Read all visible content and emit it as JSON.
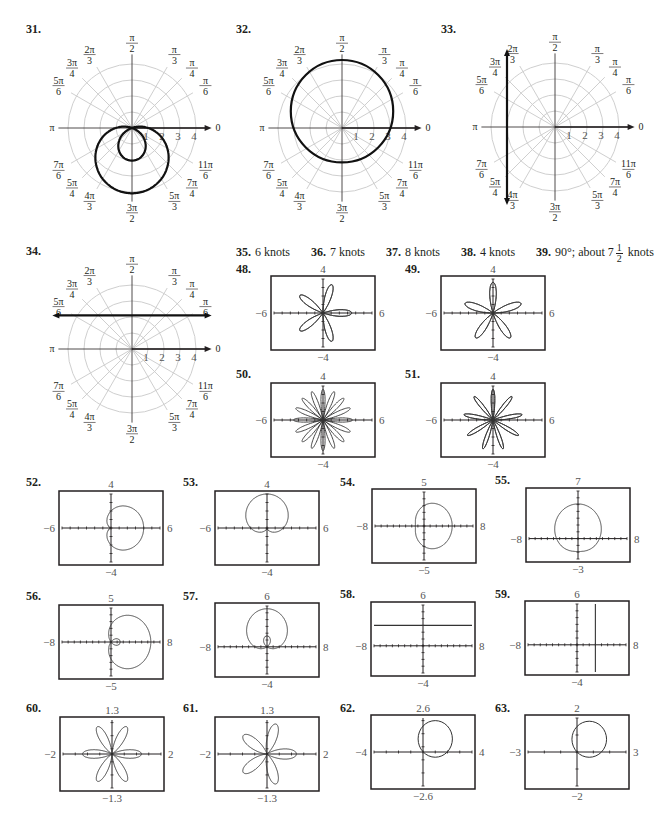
{
  "polar_graphs": [
    {
      "id": "31",
      "label": "31.",
      "label_pos": [
        26,
        22
      ],
      "center": [
        132,
        128
      ],
      "curve": {
        "type": "limacon_inner",
        "a": -1,
        "b": -3,
        "note": "r = -1 - 3 sin θ style limaçon with inner loop"
      }
    },
    {
      "id": "32",
      "label": "32.",
      "label_pos": [
        236,
        22
      ],
      "center": [
        342,
        128
      ],
      "curve": {
        "type": "circle",
        "desc": "circle through pole region, center (0,1), radius ~3.2"
      }
    },
    {
      "id": "33",
      "label": "33.",
      "label_pos": [
        441,
        22
      ],
      "center": [
        555,
        127
      ],
      "curve": {
        "type": "vertical_line",
        "x": -3
      }
    },
    {
      "id": "34",
      "label": "34.",
      "label_pos": [
        26,
        244
      ],
      "center": [
        132,
        349
      ],
      "curve": {
        "type": "horizontal_line",
        "y": 2
      }
    }
  ],
  "polar_axis": {
    "angle_labels": [
      "0",
      "π/6",
      "π/4",
      "π/3",
      "π/2",
      "2π/3",
      "3π/4",
      "5π/6",
      "π",
      "7π/6",
      "5π/4",
      "4π/3",
      "3π/2",
      "5π/3",
      "7π/4",
      "11π/6"
    ],
    "radial_ticks": [
      "1",
      "2",
      "3",
      "4"
    ]
  },
  "answers": [
    {
      "num": "35.",
      "text": "6 knots"
    },
    {
      "num": "36.",
      "text": "7 knots"
    },
    {
      "num": "37.",
      "text": "8 knots"
    },
    {
      "num": "38.",
      "text": "4 knots"
    },
    {
      "num": "39.",
      "text": "90°; about 7",
      "frac_num": "1",
      "frac_den": "2",
      "suffix": " knots"
    }
  ],
  "chart_data": [
    {
      "id": "48",
      "type": "line",
      "label": "48.",
      "xlim": [
        -6,
        6
      ],
      "ylim": [
        -4,
        4
      ],
      "curve": "rose 5 petals, one petal along +x",
      "box": [
        271,
        276,
        104,
        74
      ],
      "label_pos": [
        236,
        262
      ]
    },
    {
      "id": "49",
      "type": "line",
      "label": "49.",
      "xlim": [
        -6,
        6
      ],
      "ylim": [
        -4,
        4
      ],
      "curve": "rose 5 petals, one petal along +y",
      "box": [
        441,
        276,
        104,
        74
      ],
      "label_pos": [
        405,
        262
      ]
    },
    {
      "id": "50",
      "type": "line",
      "label": "50.",
      "xlim": [
        -6,
        6
      ],
      "ylim": [
        -4,
        4
      ],
      "curve": "rose 16 petals",
      "box": [
        271,
        383,
        104,
        74
      ],
      "label_pos": [
        236,
        367
      ]
    },
    {
      "id": "51",
      "type": "line",
      "label": "51.",
      "xlim": [
        -6,
        6
      ],
      "ylim": [
        -4,
        4
      ],
      "curve": "rose 18 petals",
      "box": [
        441,
        383,
        104,
        74
      ],
      "label_pos": [
        405,
        367
      ]
    },
    {
      "id": "52",
      "type": "line",
      "label": "52.",
      "xlim": [
        -6,
        6
      ],
      "ylim": [
        -4,
        4
      ],
      "curve": "cardioid opening right",
      "box": [
        59,
        491,
        104,
        74
      ],
      "label_pos": [
        26,
        475
      ]
    },
    {
      "id": "53",
      "type": "line",
      "label": "53.",
      "xlim": [
        -6,
        6
      ],
      "ylim": [
        -4,
        4
      ],
      "curve": "cardioid opening up",
      "box": [
        215,
        491,
        104,
        74
      ],
      "label_pos": [
        183,
        475
      ]
    },
    {
      "id": "54",
      "type": "line",
      "label": "54.",
      "xlim": [
        -8,
        8
      ],
      "ylim": [
        -5,
        5
      ],
      "curve": "dimpled limaçon right",
      "box": [
        372,
        489,
        104,
        74
      ],
      "label_pos": [
        340,
        475
      ]
    },
    {
      "id": "55",
      "type": "line",
      "label": "55.",
      "xlim": [
        -8,
        8
      ],
      "ylim": [
        -3,
        7
      ],
      "curve": "dimpled limaçon up",
      "box": [
        526,
        488,
        104,
        74
      ],
      "label_pos": [
        495,
        473
      ]
    },
    {
      "id": "56",
      "type": "line",
      "label": "56.",
      "xlim": [
        -8,
        8
      ],
      "ylim": [
        -5,
        5
      ],
      "curve": "limaçon with inner loop right",
      "box": [
        59,
        605,
        104,
        74
      ],
      "label_pos": [
        26,
        589
      ]
    },
    {
      "id": "57",
      "type": "line",
      "label": "57.",
      "xlim": [
        -8,
        8
      ],
      "ylim": [
        -4,
        6
      ],
      "curve": "limaçon with inner loop up",
      "box": [
        215,
        603,
        104,
        74
      ],
      "label_pos": [
        183,
        589
      ]
    },
    {
      "id": "58",
      "type": "line",
      "label": "58.",
      "xlim": [
        -8,
        8
      ],
      "ylim": [
        -4,
        6
      ],
      "curve": "horizontal line y=3",
      "box": [
        371,
        602,
        104,
        74
      ],
      "label_pos": [
        340,
        587
      ]
    },
    {
      "id": "59",
      "type": "line",
      "label": "59.",
      "xlim": [
        -8,
        8
      ],
      "ylim": [
        -4,
        6
      ],
      "curve": "vertical line x=3",
      "box": [
        525,
        601,
        104,
        74
      ],
      "label_pos": [
        495,
        587
      ]
    },
    {
      "id": "60",
      "type": "line",
      "label": "60.",
      "xlim": [
        -2,
        2
      ],
      "ylim": [
        -1.3,
        1.3
      ],
      "curve": "6-lobed rose-like curve",
      "box": [
        60,
        717,
        104,
        74
      ],
      "label_pos": [
        26,
        701
      ]
    },
    {
      "id": "61",
      "type": "line",
      "label": "61.",
      "xlim": [
        -2,
        2
      ],
      "ylim": [
        -1.3,
        1.3
      ],
      "curve": "10-lobed rose-like curve",
      "box": [
        215,
        717,
        104,
        74
      ],
      "label_pos": [
        183,
        701
      ]
    },
    {
      "id": "62",
      "type": "line",
      "label": "62.",
      "xlim": [
        -4,
        4
      ],
      "ylim": [
        -2.6,
        2.6
      ],
      "curve": "circle center (1,1) r≈1.4",
      "box": [
        371,
        715,
        104,
        74
      ],
      "label_pos": [
        340,
        701
      ]
    },
    {
      "id": "63",
      "type": "line",
      "label": "63.",
      "xlim": [
        -3,
        3
      ],
      "ylim": [
        -2,
        2
      ],
      "curve": "circle center (0.75,0.75) r≈1.06",
      "box": [
        525,
        715,
        104,
        74
      ],
      "label_pos": [
        495,
        701
      ]
    }
  ]
}
